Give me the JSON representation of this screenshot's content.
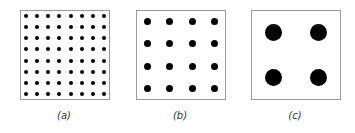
{
  "figure": {
    "panels": [
      {
        "id": "a",
        "label": "(a)",
        "grid": 8,
        "dot_diameter": 4,
        "left": 20,
        "label_x": 44
      },
      {
        "id": "b",
        "label": "(b)",
        "grid": 4,
        "dot_diameter": 7,
        "left": 136,
        "label_x": 160
      },
      {
        "id": "c",
        "label": "(c)",
        "grid": 2,
        "dot_diameter": 17,
        "left": 251,
        "label_x": 275
      }
    ],
    "colors": {
      "dot": "#000000",
      "border": "#9a9a9a",
      "background": "#ffffff"
    }
  }
}
